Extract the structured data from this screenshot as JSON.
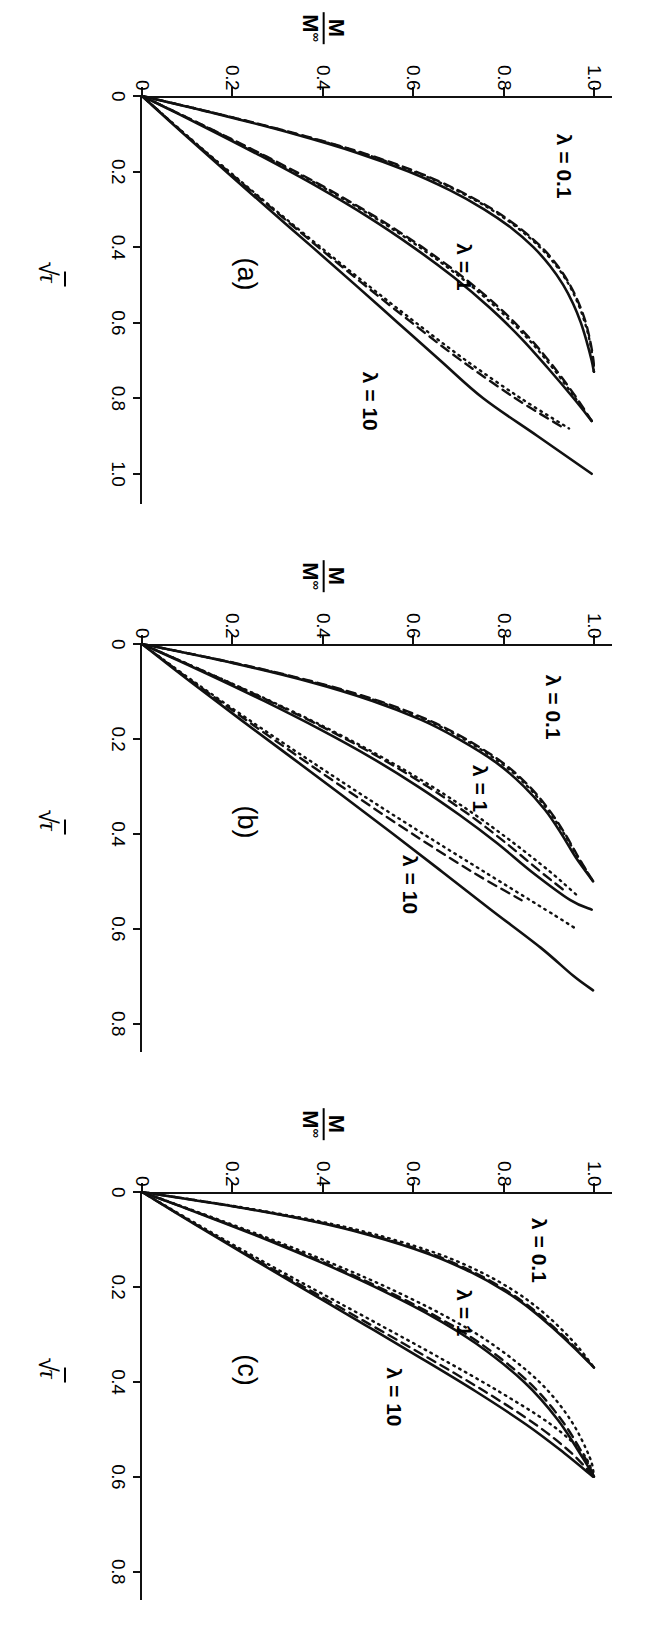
{
  "figure": {
    "orientation": "landscape-rotated-90",
    "panel_count": 3,
    "axis_label_y_num": "M",
    "axis_label_y_den": "M",
    "axis_label_y_den_sub": "∞",
    "axis_label_x_radical": "√",
    "axis_label_x_radicand": "τ",
    "background_color": "#ffffff",
    "ink_color": "#111111"
  },
  "chart_data": [
    {
      "type": "line",
      "title": "(a)",
      "xlabel": "√τ",
      "ylabel": "M/M∞",
      "xlim": [
        0,
        1.08
      ],
      "ylim": [
        0,
        1.04
      ],
      "xticks": [
        0,
        0.2,
        0.4,
        0.6,
        0.8,
        1.0
      ],
      "xticklabels": [
        "0",
        "0.2",
        "0.4",
        "0.6",
        "0.8",
        "1.0"
      ],
      "yticks": [
        0,
        0.2,
        0.4,
        0.6,
        0.8,
        1.0
      ],
      "yticklabels": [
        "0",
        "0.2",
        "0.4",
        "0.6",
        "0.8",
        "1.0"
      ],
      "grid": false,
      "legend": "inline-annotations",
      "annotations": [
        {
          "text": "λ = 0.1",
          "x": 0.1,
          "y": 0.96
        },
        {
          "text": "λ = 1",
          "x": 0.39,
          "y": 0.74
        },
        {
          "text": "λ = 10",
          "x": 0.73,
          "y": 0.53
        }
      ],
      "series": [
        {
          "name": "λ = 0.1 exact",
          "style": "solid",
          "x": [
            0,
            0.05,
            0.1,
            0.15,
            0.2,
            0.25,
            0.3,
            0.35,
            0.4,
            0.45,
            0.5,
            0.55,
            0.6,
            0.65,
            0.7,
            0.73
          ],
          "y": [
            0,
            0.175,
            0.335,
            0.475,
            0.59,
            0.682,
            0.757,
            0.818,
            0.866,
            0.903,
            0.932,
            0.954,
            0.971,
            0.984,
            0.995,
            1.0
          ]
        },
        {
          "name": "λ = 0.1 approx-dashed",
          "style": "dashed",
          "x": [
            0,
            0.05,
            0.1,
            0.15,
            0.2,
            0.25,
            0.3,
            0.35,
            0.4,
            0.45,
            0.5,
            0.55,
            0.6,
            0.65,
            0.7,
            0.73
          ],
          "y": [
            0,
            0.178,
            0.342,
            0.487,
            0.606,
            0.7,
            0.776,
            0.836,
            0.884,
            0.92,
            0.947,
            0.967,
            0.982,
            0.992,
            0.999,
            1.0
          ]
        },
        {
          "name": "λ = 0.1 approx-dotted",
          "style": "dotted",
          "x": [
            0,
            0.05,
            0.1,
            0.15,
            0.2,
            0.25,
            0.3,
            0.35,
            0.4,
            0.45,
            0.5,
            0.55,
            0.6,
            0.65,
            0.7,
            0.73
          ],
          "y": [
            0,
            0.177,
            0.34,
            0.484,
            0.602,
            0.696,
            0.772,
            0.832,
            0.88,
            0.917,
            0.945,
            0.965,
            0.98,
            0.991,
            0.998,
            1.0
          ]
        },
        {
          "name": "λ = 1 exact",
          "style": "solid",
          "x": [
            0,
            0.08,
            0.16,
            0.24,
            0.32,
            0.4,
            0.48,
            0.56,
            0.64,
            0.72,
            0.8,
            0.86
          ],
          "y": [
            0,
            0.135,
            0.265,
            0.388,
            0.5,
            0.6,
            0.69,
            0.769,
            0.838,
            0.898,
            0.955,
            0.995
          ]
        },
        {
          "name": "λ = 1 approx-dashed",
          "style": "dashed",
          "x": [
            0,
            0.08,
            0.16,
            0.24,
            0.32,
            0.4,
            0.48,
            0.56,
            0.64,
            0.72,
            0.8,
            0.86
          ],
          "y": [
            0,
            0.14,
            0.275,
            0.402,
            0.517,
            0.62,
            0.711,
            0.79,
            0.857,
            0.913,
            0.962,
            0.995
          ]
        },
        {
          "name": "λ = 1 approx-dotted",
          "style": "dotted",
          "x": [
            0,
            0.08,
            0.16,
            0.24,
            0.32,
            0.4,
            0.48,
            0.56,
            0.64,
            0.72,
            0.8,
            0.86
          ],
          "y": [
            0,
            0.139,
            0.272,
            0.398,
            0.512,
            0.614,
            0.705,
            0.784,
            0.852,
            0.909,
            0.959,
            0.995
          ]
        },
        {
          "name": "λ = 10 exact",
          "style": "solid",
          "x": [
            0,
            0.1,
            0.2,
            0.3,
            0.4,
            0.5,
            0.6,
            0.7,
            0.8,
            0.9,
            1.0
          ],
          "y": [
            0,
            0.092,
            0.186,
            0.281,
            0.377,
            0.472,
            0.566,
            0.66,
            0.755,
            0.875,
            0.995
          ]
        },
        {
          "name": "λ = 10 approx-dashed",
          "style": "dashed",
          "x": [
            0,
            0.1,
            0.2,
            0.3,
            0.4,
            0.5,
            0.6,
            0.7,
            0.8,
            0.88
          ],
          "y": [
            0,
            0.094,
            0.191,
            0.29,
            0.39,
            0.492,
            0.597,
            0.706,
            0.826,
            0.935
          ]
        },
        {
          "name": "λ = 10 approx-dotted",
          "style": "dotted",
          "x": [
            0,
            0.1,
            0.2,
            0.3,
            0.4,
            0.5,
            0.6,
            0.7,
            0.8,
            0.88
          ],
          "y": [
            0,
            0.095,
            0.193,
            0.293,
            0.395,
            0.499,
            0.606,
            0.717,
            0.838,
            0.945
          ]
        }
      ]
    },
    {
      "type": "line",
      "title": "(b)",
      "xlabel": "√τ",
      "ylabel": "M/M∞",
      "xlim": [
        0,
        0.86
      ],
      "ylim": [
        0,
        1.04
      ],
      "xticks": [
        0,
        0.2,
        0.4,
        0.6,
        0.8
      ],
      "xticklabels": [
        "0",
        "0.2",
        "0.4",
        "0.6",
        "0.8"
      ],
      "yticks": [
        0,
        0.2,
        0.4,
        0.6,
        0.8,
        1.0
      ],
      "yticklabels": [
        "0",
        "0.2",
        "0.4",
        "0.6",
        "0.8",
        "1.0"
      ],
      "grid": false,
      "legend": "inline-annotations",
      "annotations": [
        {
          "text": "λ = 0.1",
          "x": 0.065,
          "y": 0.935
        },
        {
          "text": "λ = 1",
          "x": 0.255,
          "y": 0.775
        },
        {
          "text": "λ = 10",
          "x": 0.445,
          "y": 0.62
        }
      ],
      "series": [
        {
          "name": "λ = 0.1 exact",
          "style": "solid",
          "x": [
            0,
            0.04,
            0.08,
            0.12,
            0.16,
            0.2,
            0.25,
            0.3,
            0.35,
            0.4,
            0.45,
            0.5
          ],
          "y": [
            0,
            0.2,
            0.372,
            0.51,
            0.618,
            0.7,
            0.784,
            0.845,
            0.892,
            0.928,
            0.96,
            0.998
          ]
        },
        {
          "name": "λ = 0.1 approx-dashed",
          "style": "dashed",
          "x": [
            0,
            0.04,
            0.08,
            0.12,
            0.16,
            0.2,
            0.25,
            0.3,
            0.35,
            0.4,
            0.45,
            0.5
          ],
          "y": [
            0,
            0.205,
            0.382,
            0.524,
            0.633,
            0.716,
            0.798,
            0.857,
            0.901,
            0.936,
            0.966,
            0.998
          ]
        },
        {
          "name": "λ = 0.1 approx-dotted",
          "style": "dotted",
          "x": [
            0,
            0.04,
            0.08,
            0.12,
            0.16,
            0.2,
            0.25,
            0.3,
            0.35,
            0.4,
            0.45,
            0.5
          ],
          "y": [
            0,
            0.203,
            0.378,
            0.519,
            0.628,
            0.711,
            0.793,
            0.853,
            0.898,
            0.934,
            0.965,
            0.998
          ]
        },
        {
          "name": "λ = 1 exact",
          "style": "solid",
          "x": [
            0,
            0.06,
            0.12,
            0.18,
            0.24,
            0.3,
            0.36,
            0.42,
            0.48,
            0.54,
            0.56
          ],
          "y": [
            0,
            0.138,
            0.27,
            0.394,
            0.508,
            0.61,
            0.702,
            0.786,
            0.862,
            0.948,
            0.995
          ]
        },
        {
          "name": "λ = 1 approx-dashed",
          "style": "dashed",
          "x": [
            0,
            0.06,
            0.12,
            0.18,
            0.24,
            0.3,
            0.36,
            0.42,
            0.48,
            0.52
          ],
          "y": [
            0,
            0.143,
            0.281,
            0.41,
            0.527,
            0.631,
            0.724,
            0.806,
            0.882,
            0.935
          ]
        },
        {
          "name": "λ = 1 approx-dotted",
          "style": "dotted",
          "x": [
            0,
            0.06,
            0.12,
            0.18,
            0.24,
            0.3,
            0.36,
            0.42,
            0.48,
            0.53
          ],
          "y": [
            0,
            0.144,
            0.284,
            0.415,
            0.534,
            0.641,
            0.737,
            0.823,
            0.903,
            0.963
          ]
        },
        {
          "name": "λ = 10 exact",
          "style": "solid",
          "x": [
            0,
            0.08,
            0.16,
            0.24,
            0.32,
            0.4,
            0.48,
            0.56,
            0.64,
            0.7,
            0.73
          ],
          "y": [
            0,
            0.108,
            0.219,
            0.332,
            0.444,
            0.555,
            0.664,
            0.772,
            0.882,
            0.955,
            0.998
          ]
        },
        {
          "name": "λ = 10 approx-dashed",
          "style": "dashed",
          "x": [
            0,
            0.08,
            0.16,
            0.24,
            0.32,
            0.4,
            0.48,
            0.54
          ],
          "y": [
            0,
            0.113,
            0.23,
            0.35,
            0.472,
            0.598,
            0.73,
            0.84
          ]
        },
        {
          "name": "λ = 10 approx-dotted",
          "style": "dotted",
          "x": [
            0,
            0.08,
            0.16,
            0.24,
            0.32,
            0.4,
            0.48,
            0.56,
            0.6
          ],
          "y": [
            0,
            0.116,
            0.237,
            0.362,
            0.49,
            0.622,
            0.757,
            0.893,
            0.96
          ]
        }
      ]
    },
    {
      "type": "line",
      "title": "(c)",
      "xlabel": "√τ",
      "ylabel": "M/M∞",
      "xlim": [
        0,
        0.86
      ],
      "ylim": [
        0,
        1.04
      ],
      "xticks": [
        0,
        0.2,
        0.4,
        0.6,
        0.8
      ],
      "xticklabels": [
        "0",
        "0.2",
        "0.4",
        "0.6",
        "0.8"
      ],
      "yticks": [
        0,
        0.2,
        0.4,
        0.6,
        0.8,
        1.0
      ],
      "yticklabels": [
        "0",
        "0.2",
        "0.4",
        "0.6",
        "0.8",
        "1.0"
      ],
      "grid": false,
      "legend": "inline-annotations",
      "annotations": [
        {
          "text": "λ = 0.1",
          "x": 0.055,
          "y": 0.905
        },
        {
          "text": "λ = 1",
          "x": 0.205,
          "y": 0.74
        },
        {
          "text": "λ = 10",
          "x": 0.37,
          "y": 0.585
        }
      ],
      "series": [
        {
          "name": "λ = 0.1 exact",
          "style": "solid",
          "x": [
            0,
            0.03,
            0.06,
            0.09,
            0.13,
            0.17,
            0.21,
            0.25,
            0.29,
            0.33,
            0.37
          ],
          "y": [
            0,
            0.2,
            0.37,
            0.5,
            0.633,
            0.73,
            0.805,
            0.864,
            0.913,
            0.958,
            1.0
          ]
        },
        {
          "name": "λ = 0.1 approx-dashed",
          "style": "dashed",
          "x": [
            0,
            0.03,
            0.06,
            0.09,
            0.13,
            0.17,
            0.21,
            0.25,
            0.29,
            0.33,
            0.37
          ],
          "y": [
            0,
            0.202,
            0.374,
            0.505,
            0.639,
            0.736,
            0.81,
            0.869,
            0.917,
            0.961,
            1.0
          ]
        },
        {
          "name": "λ = 0.1 approx-dotted",
          "style": "dotted",
          "x": [
            0,
            0.03,
            0.06,
            0.09,
            0.13,
            0.17,
            0.21,
            0.25,
            0.29,
            0.33,
            0.37
          ],
          "y": [
            0,
            0.206,
            0.383,
            0.518,
            0.654,
            0.752,
            0.826,
            0.883,
            0.929,
            0.968,
            1.0
          ]
        },
        {
          "name": "λ = 1 exact",
          "style": "solid",
          "x": [
            0,
            0.05,
            0.1,
            0.15,
            0.2,
            0.26,
            0.32,
            0.4,
            0.48,
            0.56,
            0.6
          ],
          "y": [
            0,
            0.14,
            0.275,
            0.4,
            0.515,
            0.638,
            0.74,
            0.845,
            0.92,
            0.975,
            1.0
          ]
        },
        {
          "name": "λ = 1 approx-dashed",
          "style": "dashed",
          "x": [
            0,
            0.05,
            0.1,
            0.15,
            0.2,
            0.26,
            0.32,
            0.4,
            0.48,
            0.56,
            0.6
          ],
          "y": [
            0,
            0.142,
            0.279,
            0.406,
            0.523,
            0.647,
            0.75,
            0.855,
            0.928,
            0.98,
            1.0
          ]
        },
        {
          "name": "λ = 1 approx-dotted",
          "style": "dotted",
          "x": [
            0,
            0.05,
            0.1,
            0.15,
            0.2,
            0.26,
            0.32,
            0.4,
            0.48,
            0.56,
            0.6
          ],
          "y": [
            0,
            0.146,
            0.287,
            0.419,
            0.54,
            0.668,
            0.774,
            0.879,
            0.948,
            0.991,
            1.0
          ]
        },
        {
          "name": "λ = 10 exact",
          "style": "solid",
          "x": [
            0,
            0.07,
            0.14,
            0.21,
            0.28,
            0.35,
            0.42,
            0.49,
            0.55,
            0.6
          ],
          "y": [
            0,
            0.12,
            0.243,
            0.368,
            0.493,
            0.617,
            0.738,
            0.85,
            0.934,
            0.998
          ]
        },
        {
          "name": "λ = 10 approx-dashed",
          "style": "dashed",
          "x": [
            0,
            0.07,
            0.14,
            0.21,
            0.28,
            0.35,
            0.42,
            0.49,
            0.55,
            0.6
          ],
          "y": [
            0,
            0.122,
            0.248,
            0.377,
            0.506,
            0.634,
            0.758,
            0.871,
            0.95,
            1.0
          ]
        },
        {
          "name": "λ = 10 approx-dotted",
          "style": "dotted",
          "x": [
            0,
            0.07,
            0.14,
            0.21,
            0.28,
            0.35,
            0.42,
            0.49,
            0.55,
            0.6
          ],
          "y": [
            0,
            0.126,
            0.256,
            0.39,
            0.526,
            0.66,
            0.789,
            0.905,
            0.975,
            1.0
          ]
        }
      ]
    }
  ]
}
